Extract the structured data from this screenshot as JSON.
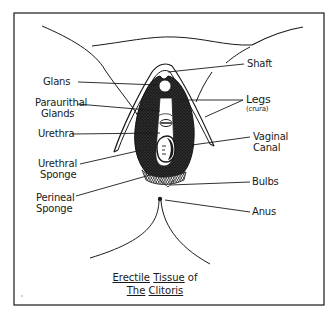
{
  "title": {
    "line1_part1": "Erectile",
    "line1_part2": "Tissue",
    "line1_part3": "of",
    "line2_part1": "The",
    "line2_part2": "Clitoris"
  },
  "labels": {
    "left": [
      {
        "id": "glans",
        "lines": [
          "Glans"
        ]
      },
      {
        "id": "paraurethral-glands",
        "lines": [
          "Paraurithal",
          "Glands"
        ]
      },
      {
        "id": "urethra",
        "lines": [
          "Urethra"
        ]
      },
      {
        "id": "urethral-sponge",
        "lines": [
          "Urethral",
          "Sponge"
        ]
      },
      {
        "id": "perineal-sponge",
        "lines": [
          "Perineal",
          "Sponge"
        ]
      }
    ],
    "right": [
      {
        "id": "shaft",
        "lines": [
          "Shaft"
        ]
      },
      {
        "id": "legs",
        "lines": [
          "Legs",
          "(crura)"
        ]
      },
      {
        "id": "vaginal-canal",
        "lines": [
          "Vaginal",
          "Canal"
        ]
      },
      {
        "id": "bulbs",
        "lines": [
          "Bulbs"
        ]
      },
      {
        "id": "anus",
        "lines": [
          "Anus"
        ]
      }
    ]
  },
  "colors": {
    "ink": "#1a1a1a",
    "paper": "#ffffff",
    "tissue_fill": "#222222"
  }
}
